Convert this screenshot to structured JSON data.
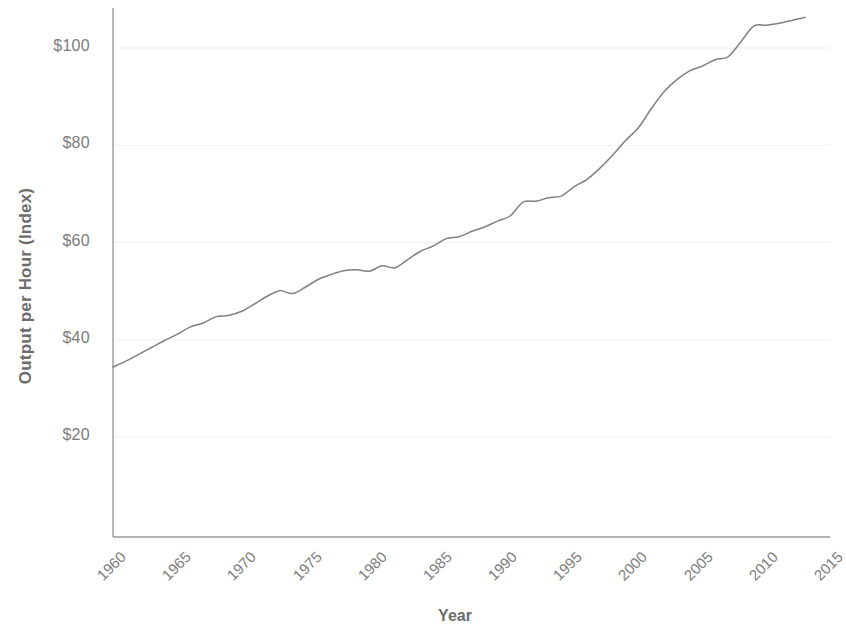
{
  "chart_data": {
    "type": "line",
    "title": "",
    "xlabel": "Year",
    "ylabel": "Output per Hour (Index)",
    "xlim": [
      1960,
      2015
    ],
    "ylim": [
      0,
      108
    ],
    "xticks": [
      1960,
      1965,
      1970,
      1975,
      1980,
      1985,
      1990,
      1995,
      2000,
      2005,
      2010,
      2015
    ],
    "xtick_labels": [
      "1960",
      "1965",
      "1970",
      "1975",
      "1980",
      "1985",
      "1990",
      "1995",
      "2000",
      "2005",
      "2010",
      "2015"
    ],
    "yticks": [
      20,
      40,
      60,
      80,
      100
    ],
    "ytick_labels": [
      "$20",
      "$40",
      "$60",
      "$80",
      "$100"
    ],
    "grid": true,
    "grid_axis": "y",
    "legend": false,
    "line_color": "#808080",
    "series": [
      {
        "name": "Output per Hour (Index)",
        "x": [
          1960,
          1961,
          1962,
          1963,
          1964,
          1965,
          1966,
          1967,
          1968,
          1969,
          1970,
          1971,
          1972,
          1973,
          1974,
          1975,
          1976,
          1977,
          1978,
          1979,
          1980,
          1981,
          1982,
          1983,
          1984,
          1985,
          1986,
          1987,
          1988,
          1989,
          1990,
          1991,
          1992,
          1993,
          1994,
          1995,
          1996,
          1997,
          1998,
          1999,
          2000,
          2001,
          2002,
          2003,
          2004,
          2005,
          2006,
          2007,
          2008,
          2009,
          2010,
          2011,
          2012,
          2013,
          2014
        ],
        "values": [
          34.4,
          35.6,
          37.0,
          38.4,
          39.8,
          41.1,
          42.6,
          43.4,
          44.7,
          45.0,
          45.8,
          47.3,
          48.9,
          50.1,
          49.5,
          50.8,
          52.4,
          53.4,
          54.2,
          54.4,
          54.1,
          55.2,
          54.8,
          56.5,
          58.2,
          59.3,
          60.8,
          61.2,
          62.3,
          63.2,
          64.4,
          65.5,
          68.3,
          68.5,
          69.2,
          69.6,
          71.5,
          73.0,
          75.3,
          78.0,
          81.0,
          83.6,
          87.5,
          91.0,
          93.5,
          95.3,
          96.3,
          97.6,
          98.2,
          101.3,
          104.5,
          104.7,
          105.1,
          105.7,
          106.3
        ]
      }
    ]
  }
}
